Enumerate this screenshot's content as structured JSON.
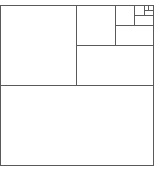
{
  "diagram": {
    "type": "recursive-subdivision",
    "stroke_color": "#5a5a5a",
    "background": "#ffffff",
    "bounds": {
      "x": 0.5,
      "y": 5.5,
      "w": 153,
      "h": 160
    },
    "lines": [
      {
        "id": "split-1-horizontal",
        "x1": 0.5,
        "y1": 85.5,
        "x2": 153.5,
        "y2": 85.5
      },
      {
        "id": "split-2-vertical",
        "x1": 76.5,
        "y1": 5.5,
        "x2": 76.5,
        "y2": 85.5
      },
      {
        "id": "split-3-horizontal",
        "x1": 76.5,
        "y1": 45.5,
        "x2": 153.5,
        "y2": 45.5
      },
      {
        "id": "split-4-vertical",
        "x1": 115.5,
        "y1": 5.5,
        "x2": 115.5,
        "y2": 45.5
      },
      {
        "id": "split-5-horizontal",
        "x1": 115.5,
        "y1": 25.5,
        "x2": 153.5,
        "y2": 25.5
      },
      {
        "id": "split-6-vertical",
        "x1": 134.5,
        "y1": 5.5,
        "x2": 134.5,
        "y2": 25.5
      },
      {
        "id": "split-7-horizontal",
        "x1": 134.5,
        "y1": 15.5,
        "x2": 153.5,
        "y2": 15.5
      },
      {
        "id": "split-8-vertical",
        "x1": 144.5,
        "y1": 5.5,
        "x2": 144.5,
        "y2": 15.5
      },
      {
        "id": "split-9-horizontal",
        "x1": 144.5,
        "y1": 10.5,
        "x2": 153.5,
        "y2": 10.5
      },
      {
        "id": "split-10-vertical",
        "x1": 148.5,
        "y1": 5.5,
        "x2": 148.5,
        "y2": 10.5
      }
    ]
  }
}
